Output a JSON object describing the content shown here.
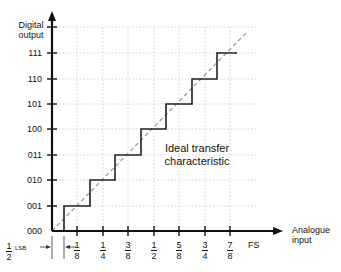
{
  "diagram": {
    "y_axis_label": [
      "Digital",
      "output"
    ],
    "x_axis_label": [
      "Analogue",
      "input"
    ],
    "output_codes": [
      "000",
      "001",
      "010",
      "011",
      "100",
      "101",
      "110",
      "111"
    ],
    "input_ticks": [
      {
        "num": "1",
        "den": "8"
      },
      {
        "num": "1",
        "den": "4"
      },
      {
        "num": "3",
        "den": "8"
      },
      {
        "num": "1",
        "den": "2"
      },
      {
        "num": "5",
        "den": "8"
      },
      {
        "num": "3",
        "den": "4"
      },
      {
        "num": "7",
        "den": "8"
      }
    ],
    "full_scale_label": "FS",
    "half_lsb": {
      "num": "1",
      "den": "2",
      "unit": "LSB"
    },
    "annotation": [
      "Ideal transfer",
      "characteristic"
    ],
    "colors": {
      "axis": "#111111",
      "staircase": "#222222",
      "ideal_line": "#9a9a9a",
      "grid": "#c8c8c8"
    }
  }
}
